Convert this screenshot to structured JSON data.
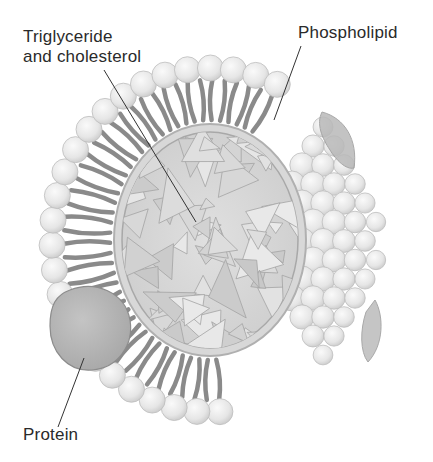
{
  "diagram": {
    "labels": {
      "triglyceride": {
        "line1": "Triglyceride",
        "line2": "and cholesterol"
      },
      "phospholipid": "Phospholipid",
      "protein": "Protein"
    },
    "colors": {
      "background": "#ffffff",
      "head_fill": "#ececec",
      "head_stroke": "#bdbdbd",
      "tail": "#8a8a8a",
      "core_fill": "#d6d6d6",
      "core_stroke": "#9e9e9e",
      "protein_fill": "#b5b5b5",
      "leader_line": "#333333",
      "text": "#2a2a2a"
    }
  }
}
